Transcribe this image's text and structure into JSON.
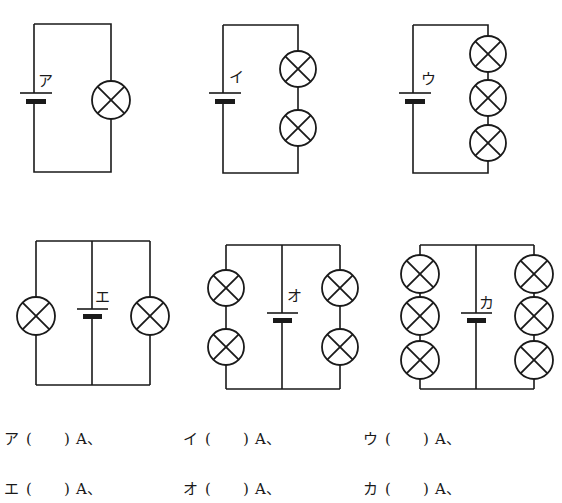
{
  "colors": {
    "ink": "#1a1a1a",
    "background": "#ffffff"
  },
  "circuits": [
    {
      "id": "a",
      "label": "ア",
      "type": "series",
      "lamps_per_branch": 1,
      "branches": 1,
      "battery_count": 1
    },
    {
      "id": "i",
      "label": "イ",
      "type": "series",
      "lamps_per_branch": 2,
      "branches": 1,
      "battery_count": 1
    },
    {
      "id": "u",
      "label": "ウ",
      "type": "series",
      "lamps_per_branch": 3,
      "branches": 1,
      "battery_count": 1
    },
    {
      "id": "e",
      "label": "エ",
      "type": "parallel",
      "lamps_per_branch": 1,
      "branches": 2,
      "battery_count": 1
    },
    {
      "id": "o",
      "label": "オ",
      "type": "parallel",
      "lamps_per_branch": 2,
      "branches": 2,
      "battery_count": 1
    },
    {
      "id": "ka",
      "label": "カ",
      "type": "parallel",
      "lamps_per_branch": 3,
      "branches": 2,
      "battery_count": 1
    }
  ],
  "answers": [
    {
      "label": "ア",
      "open": "(",
      "value": "",
      "close": ")",
      "unit": "A、"
    },
    {
      "label": "イ",
      "open": "(",
      "value": "",
      "close": ")",
      "unit": "A、"
    },
    {
      "label": "ウ",
      "open": "(",
      "value": "",
      "close": ")",
      "unit": "A、"
    },
    {
      "label": "エ",
      "open": "(",
      "value": "",
      "close": ")",
      "unit": "A、"
    },
    {
      "label": "オ",
      "open": "(",
      "value": "",
      "close": ")",
      "unit": "A、"
    },
    {
      "label": "カ",
      "open": "(",
      "value": "",
      "close": ")",
      "unit": "A、"
    }
  ]
}
